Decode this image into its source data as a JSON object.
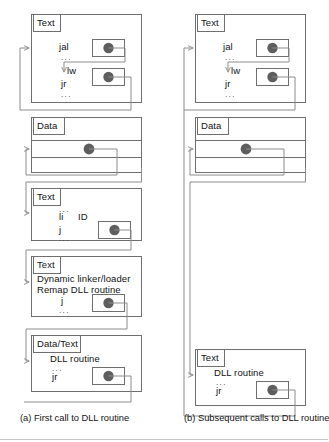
{
  "figure": {
    "kind": "diagram",
    "title": "",
    "colors": {
      "box_stroke": "#6f6f6f",
      "tag_stroke": "#6f6f6f",
      "pointer_stroke": "#7a7a7a",
      "arrow_stroke": "#8c8c8c",
      "dot_fill": "#5e5e5e",
      "background": "#ffffff",
      "text": "#131313"
    },
    "panels": [
      {
        "id": "a",
        "caption": "(a) First call to DLL routine",
        "blocks": [
          {
            "tag": "Text",
            "lines": [
              "jal",
              "...",
              "lw",
              "jr",
              "..."
            ],
            "pointers": 2
          },
          {
            "tag": "Data",
            "lines": [],
            "pointers": 1
          },
          {
            "tag": "Text",
            "lines": [
              "...",
              "li",
              "ID",
              "j",
              "..."
            ],
            "pointers": 1
          },
          {
            "tag": "Text",
            "lines": [
              "Dynamic linker/loader",
              "Remap DLL routine",
              "j",
              "..."
            ],
            "pointers": 1
          },
          {
            "tag": "Data/Text",
            "lines": [
              "DLL routine",
              "...",
              "jr"
            ],
            "pointers": 1
          }
        ]
      },
      {
        "id": "b",
        "caption": "(b) Subsequent calls to DLL routine",
        "blocks": [
          {
            "tag": "Text",
            "lines": [
              "jal",
              "...",
              "lw",
              "jr",
              "..."
            ],
            "pointers": 2
          },
          {
            "tag": "Data",
            "lines": [],
            "pointers": 1
          },
          {
            "tag": "Text",
            "lines": [
              "DLL routine",
              "...",
              "jr"
            ],
            "pointers": 1
          }
        ]
      }
    ],
    "labels": {
      "tag_text": "Text",
      "tag_data": "Data",
      "tag_data_text": "Data/Text",
      "jal": "jal",
      "lw": "lw",
      "jr": "jr",
      "j": "j",
      "li": "li",
      "id": "ID",
      "dots": "...",
      "dyn_linker": "Dynamic linker/loader",
      "remap": "Remap DLL routine",
      "dll_routine": "DLL routine"
    }
  }
}
